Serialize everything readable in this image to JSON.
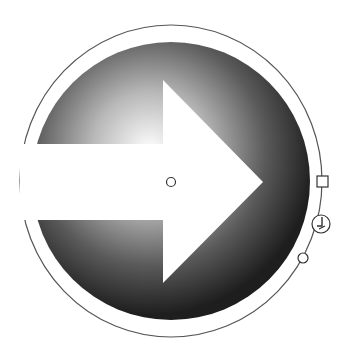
{
  "canvas": {
    "width": 342,
    "height": 345,
    "background": "#ffffff"
  },
  "shape": {
    "type": "circle",
    "fill": "radial-gradient",
    "gradient_stops": [
      {
        "offset": "0%",
        "color": "#ffffff"
      },
      {
        "offset": "35%",
        "color": "#b8b8b8"
      },
      {
        "offset": "70%",
        "color": "#5a5a5a"
      },
      {
        "offset": "100%",
        "color": "#1e1e1e"
      }
    ],
    "icon": "arrow-right-icon",
    "icon_color": "#ffffff"
  },
  "gradient_tool": {
    "ring_color": "#555555",
    "handles": [
      {
        "name": "center-handle",
        "shape": "circle"
      },
      {
        "name": "radius-handle",
        "shape": "square"
      },
      {
        "name": "rotate-handle",
        "shape": "circle-with-glyph"
      },
      {
        "name": "focus-handle",
        "shape": "circle"
      }
    ]
  }
}
